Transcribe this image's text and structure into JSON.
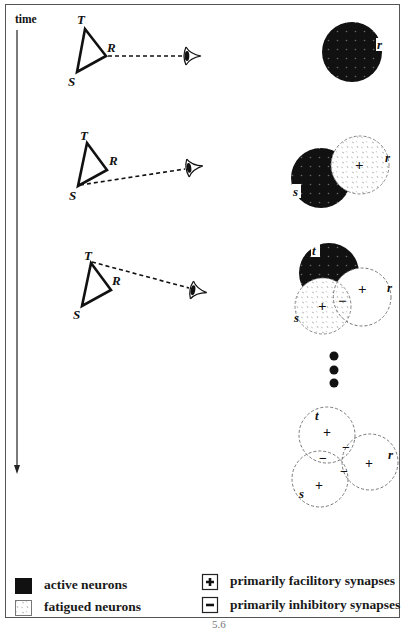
{
  "axis": {
    "time_label": "time",
    "direction": "down"
  },
  "panels": [
    {
      "step": 1,
      "triangle_labels": {
        "T": "T",
        "R": "R",
        "S": "S"
      },
      "fixated_vertex": "R",
      "neurons": [
        {
          "id": "r",
          "label": "r",
          "state": "active",
          "synapse": ""
        }
      ]
    },
    {
      "step": 2,
      "triangle_labels": {
        "T": "T",
        "R": "R",
        "S": "S"
      },
      "fixated_vertex": "S",
      "neurons": [
        {
          "id": "s",
          "label": "s",
          "state": "active",
          "synapse": ""
        },
        {
          "id": "r",
          "label": "r",
          "state": "fatigued",
          "synapse": "+"
        }
      ]
    },
    {
      "step": 3,
      "triangle_labels": {
        "T": "T",
        "R": "R",
        "S": "S"
      },
      "fixated_vertex": "T",
      "neurons": [
        {
          "id": "t",
          "label": "t",
          "state": "active",
          "synapse": ""
        },
        {
          "id": "s",
          "label": "s",
          "state": "fatigued",
          "synapse": "+"
        },
        {
          "id": "r",
          "label": "r",
          "state": "inactive",
          "synapse": "+"
        }
      ],
      "overlap_synapses": [
        "-"
      ]
    },
    {
      "step": 4,
      "neurons": [
        {
          "id": "t",
          "label": "t",
          "state": "inactive",
          "synapse": "+"
        },
        {
          "id": "s",
          "label": "s",
          "state": "inactive",
          "synapse": "+"
        },
        {
          "id": "r",
          "label": "r",
          "state": "inactive",
          "synapse": "+"
        }
      ],
      "overlap_synapses": [
        "-",
        "-",
        "-"
      ]
    }
  ],
  "ellipsis": "• • •",
  "legend": {
    "active": "active neurons",
    "fatigued": "fatigued neurons",
    "facilitory": "primarily facilitory synapses",
    "inhibitory": "primarily inhibitory synapses",
    "plus_symbol": "+",
    "minus_symbol": "−"
  },
  "labels": {
    "T": "T",
    "R": "R",
    "S": "S",
    "t": "t",
    "r": "r",
    "s": "s",
    "plus": "+",
    "minus": "−"
  },
  "page_number_fragment": "5.6",
  "colors": {
    "active_fill": "#111111",
    "dot": "#6a6a6a",
    "fatigued_stroke": "#888888",
    "line": "#111111",
    "frame": "#555555"
  }
}
